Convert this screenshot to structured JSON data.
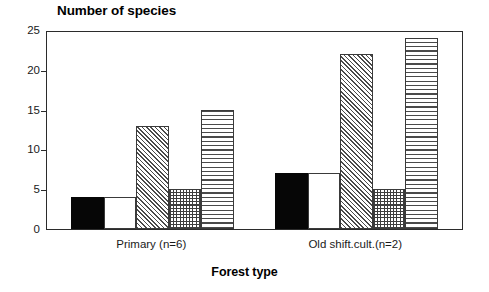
{
  "chart_data": {
    "type": "bar",
    "title": "Number of species",
    "xlabel": "Forest type",
    "ylabel": "",
    "categories": [
      "Primary (n=6)",
      "Old shift.cult.(n=2)"
    ],
    "ylim": [
      0,
      25
    ],
    "yticks": [
      0,
      5,
      10,
      15,
      20,
      25
    ],
    "ytick_labels": [
      "0",
      "5",
      "10",
      "15",
      "20",
      "25"
    ],
    "grid": false,
    "legend": "none",
    "series": [
      {
        "name": "series-1",
        "pattern": "solid-black",
        "values": [
          4,
          7
        ]
      },
      {
        "name": "series-2",
        "pattern": "empty-white",
        "values": [
          4,
          7
        ]
      },
      {
        "name": "series-3",
        "pattern": "diagonal-hatch",
        "values": [
          13,
          22
        ]
      },
      {
        "name": "series-4",
        "pattern": "crosshatch-grid",
        "values": [
          5,
          5
        ]
      },
      {
        "name": "series-5",
        "pattern": "horizontal-lines",
        "values": [
          15,
          24
        ]
      }
    ]
  },
  "colors": {
    "axis": "#2b2b2b",
    "solid_fill": "#060606",
    "hatch": "#4a4a4a",
    "background": "#ffffff"
  }
}
